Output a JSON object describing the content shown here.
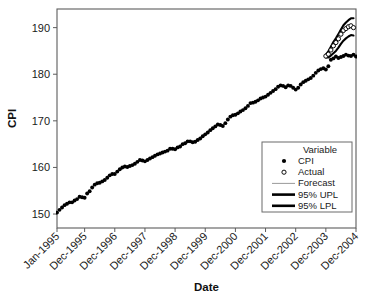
{
  "chart_data": {
    "type": "line",
    "title": "",
    "xlabel": "Date",
    "ylabel": "CPI",
    "ylim": [
      147,
      194
    ],
    "yticks": [
      150,
      160,
      170,
      180,
      190
    ],
    "ytick_labels": [
      "150",
      "160",
      "170",
      "180",
      "190"
    ],
    "xtick_labels": [
      "Jan-1995",
      "Dec-1995",
      "Dec-1996",
      "Dec-1997",
      "Dec-1998",
      "Dec-1999",
      "Dec-2000",
      "Dec-2001",
      "Dec-2002",
      "Dec-2003",
      "Dec-2004"
    ],
    "xtick_index": [
      0,
      11,
      23,
      35,
      47,
      59,
      71,
      83,
      95,
      107,
      119
    ],
    "xlim_index": [
      0,
      119
    ],
    "grid": false,
    "legend_position": "lower-right",
    "legend_title": "Variable",
    "series": [
      {
        "name": "CPI",
        "marker": "filled-circle",
        "color": "#000000",
        "x_start_index": 0,
        "values": [
          150.3,
          150.9,
          151.4,
          151.9,
          152.2,
          152.5,
          152.5,
          152.9,
          153.2,
          153.7,
          153.6,
          153.5,
          154.4,
          154.9,
          155.7,
          156.3,
          156.6,
          156.7,
          157.0,
          157.3,
          157.8,
          158.3,
          158.6,
          158.6,
          159.1,
          159.6,
          160.0,
          160.2,
          160.1,
          160.3,
          160.5,
          160.8,
          161.2,
          161.6,
          161.5,
          161.3,
          161.6,
          161.9,
          162.2,
          162.5,
          162.8,
          163.0,
          163.2,
          163.4,
          163.6,
          164.0,
          164.0,
          163.9,
          164.3,
          164.5,
          165.0,
          165.2,
          165.6,
          165.6,
          165.4,
          165.5,
          165.9,
          166.2,
          166.7,
          167.1,
          167.5,
          168.0,
          168.4,
          168.8,
          169.2,
          169.1,
          168.9,
          169.5,
          170.3,
          170.9,
          171.2,
          171.3,
          171.6,
          172.0,
          172.3,
          172.7,
          173.2,
          173.8,
          173.9,
          174.1,
          174.4,
          174.8,
          175.0,
          175.2,
          175.6,
          176.0,
          176.4,
          176.8,
          177.3,
          177.6,
          177.5,
          177.2,
          177.6,
          177.5,
          177.1,
          176.7,
          177.1,
          177.8,
          178.3,
          178.6,
          178.9,
          179.2,
          179.7,
          180.3,
          180.8,
          181.1,
          181.3,
          181.0,
          181.7,
          183.1,
          183.4,
          183.8,
          183.5,
          183.7,
          183.9,
          184.2,
          184.0,
          183.9,
          184.2,
          183.8
        ]
      },
      {
        "name": "Actual",
        "marker": "open-circle",
        "color": "#000000",
        "x_start_index": 107,
        "values": [
          183.9,
          184.3,
          185.2,
          186.1,
          186.8,
          187.6,
          188.6,
          189.4,
          189.8,
          190.2,
          190.4,
          190.0
        ]
      },
      {
        "name": "Forecast",
        "marker": "thin-line",
        "color": "#9a9a9a",
        "x_start_index": 107,
        "values": [
          183.9,
          184.2,
          184.9,
          185.7,
          186.4,
          187.2,
          188.1,
          188.9,
          189.4,
          189.9,
          190.2,
          190.1
        ]
      },
      {
        "name": "95% UPL",
        "marker": "thick-line",
        "color": "#000000",
        "x_start_index": 107,
        "values": [
          184.2,
          184.9,
          185.9,
          186.9,
          187.7,
          188.6,
          189.6,
          190.5,
          191.1,
          191.6,
          192.0,
          192.0
        ]
      },
      {
        "name": "95% LPL",
        "marker": "thick-line",
        "color": "#000000",
        "x_start_index": 107,
        "values": [
          183.6,
          183.6,
          184.0,
          184.5,
          185.0,
          185.7,
          186.5,
          187.2,
          187.7,
          188.1,
          188.4,
          188.3
        ]
      }
    ],
    "legend_entries": [
      {
        "label": "CPI",
        "marker": "filled-circle",
        "color": "#000000"
      },
      {
        "label": "Actual",
        "marker": "open-circle",
        "color": "#000000"
      },
      {
        "label": "Forecast",
        "marker": "thin-line",
        "color": "#9a9a9a"
      },
      {
        "label": "95% UPL",
        "marker": "thick-line",
        "color": "#000000"
      },
      {
        "label": "95% LPL",
        "marker": "thick-line",
        "color": "#000000"
      }
    ]
  },
  "layout": {
    "plot_left": 57,
    "plot_right": 356,
    "plot_top": 9,
    "plot_bottom": 228,
    "legend_x": 262,
    "legend_y": 142,
    "legend_w": 90,
    "legend_h": 70
  }
}
